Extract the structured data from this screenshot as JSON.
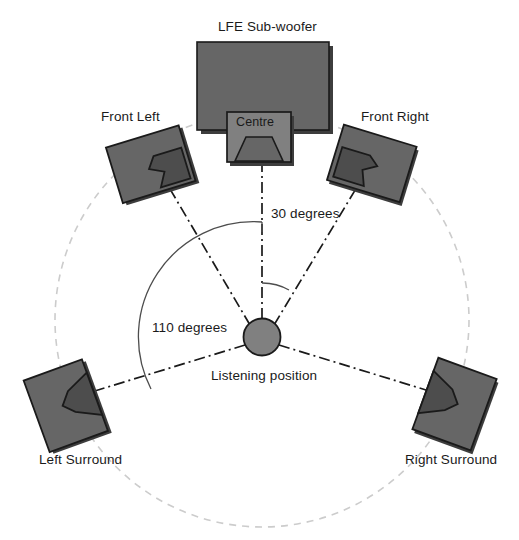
{
  "diagram": {
    "labels": {
      "subwoofer": "LFE Sub-woofer",
      "front_left": "Front Left",
      "front_right": "Front Right",
      "centre": "Centre",
      "left_surround": "Left Surround",
      "right_surround": "Right Surround",
      "listening_position": "Listening position",
      "angle_front": "30 degrees",
      "angle_surround": "110 degrees"
    },
    "colors": {
      "speaker_fill": "#666666",
      "speaker_cone": "#4d4d4d",
      "speaker_outline": "#1a1a1a",
      "centre_fill": "#808080",
      "listener_fill": "#808080",
      "dashed_circle": "#cccccc",
      "axis_line": "#1a1a1a",
      "arc_line": "#4d4d4d",
      "text": "#1a1a1a",
      "background": "#ffffff"
    },
    "geometry": {
      "listening_position": {
        "x": 262,
        "y": 337,
        "r": 18
      },
      "dashed_circle": {
        "cx": 262,
        "cy": 320,
        "r": 207
      },
      "angle_front_degrees": 30,
      "angle_surround_degrees": 110
    }
  }
}
